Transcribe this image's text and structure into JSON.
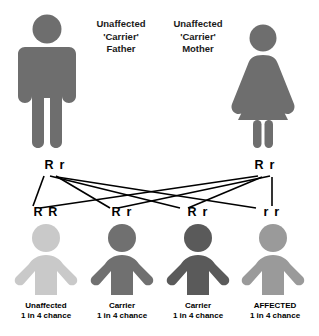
{
  "diagram": {
    "type": "autosomal-recessive-punnett-inheritance",
    "colors": {
      "parent_gray": "#6e6e6e",
      "unaffected_light": "#c9c9c9",
      "carrier_mid": "#707070",
      "carrier_dark": "#5a5a5a",
      "affected_gray": "#9a9a9a",
      "line": "#000000",
      "text": "#000000"
    }
  },
  "parents": [
    {
      "id": "father",
      "sex": "male",
      "label": "Unaffected\n'Carrier'\nFather",
      "genotype": "R r",
      "icon": "male-figure-icon"
    },
    {
      "id": "mother",
      "sex": "female",
      "label": "Unaffected\n'Carrier'\nMother",
      "genotype": "R r",
      "icon": "female-figure-icon"
    }
  ],
  "children": [
    {
      "id": "child-1",
      "genotype": "R R",
      "status": "Unaffected",
      "chance": "1 in 4 chance",
      "icon": "child-figure-icon"
    },
    {
      "id": "child-2",
      "genotype": "R r",
      "status": "Carrier",
      "chance": "1 in 4 chance",
      "icon": "child-figure-icon"
    },
    {
      "id": "child-3",
      "genotype": "R r",
      "status": "Carrier",
      "chance": "1 in 4 chance",
      "icon": "child-figure-icon"
    },
    {
      "id": "child-4",
      "genotype": "r r",
      "status": "AFFECTED",
      "chance": "1 in 4 chance",
      "icon": "child-figure-icon"
    }
  ]
}
